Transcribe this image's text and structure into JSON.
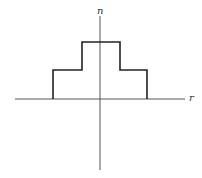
{
  "diagram": {
    "type": "step-index profile",
    "axes": {
      "vertical_label": "n",
      "horizontal_label": "r",
      "origin": [
        100,
        99
      ],
      "vertical": {
        "x": 100,
        "y1": 16,
        "y2": 170
      },
      "horizontal": {
        "y": 99,
        "x1": 15,
        "x2": 185
      }
    },
    "profile": {
      "points": [
        [
          53,
          99
        ],
        [
          53,
          70
        ],
        [
          82,
          70
        ],
        [
          82,
          42
        ],
        [
          120,
          42
        ],
        [
          120,
          70
        ],
        [
          147,
          70
        ],
        [
          147,
          99
        ]
      ],
      "levels": [
        "cladding step",
        "core step"
      ],
      "symmetric": true
    },
    "colors": {
      "axis": "#555555",
      "profile": "#222222",
      "background": "#ffffff"
    }
  }
}
